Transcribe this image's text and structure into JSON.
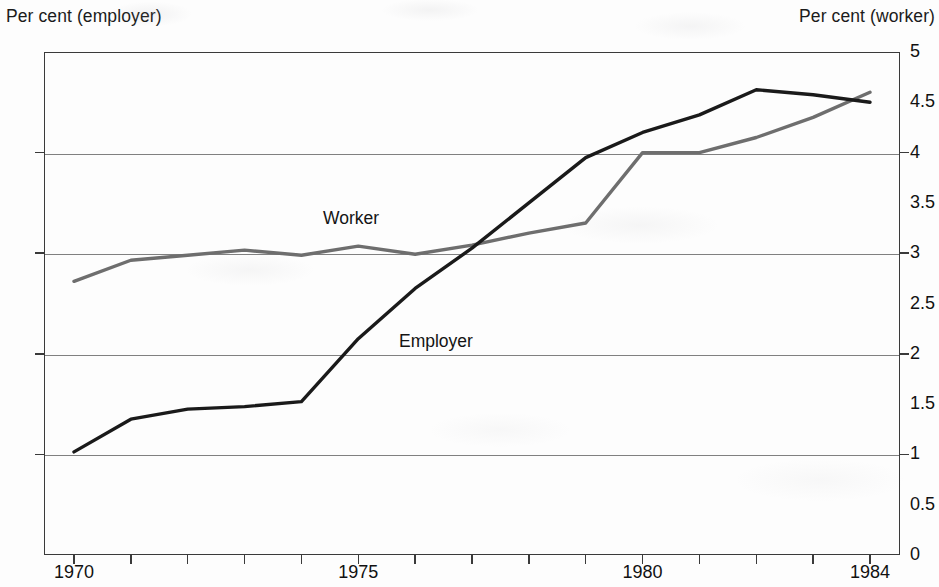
{
  "chart_data": {
    "type": "line",
    "title": "",
    "left_axis": {
      "label": "Per cent (employer)",
      "ticks": [
        "22",
        "20",
        "18",
        "16",
        "14",
        "12"
      ],
      "tick_values": [
        22,
        20,
        18,
        16,
        14,
        12
      ],
      "ylim": [
        12,
        22
      ]
    },
    "right_axis": {
      "label": "Per cent (worker)",
      "ticks": [
        "5",
        "4.5",
        "4",
        "3.5",
        "3",
        "2.5",
        "2",
        "1.5",
        "1",
        "0.5",
        "0"
      ],
      "tick_values": [
        5,
        4.5,
        4,
        3.5,
        3,
        2.5,
        2,
        1.5,
        1,
        0.5,
        0
      ],
      "ylim": [
        0,
        5
      ]
    },
    "xlabel": "",
    "x": [
      1970,
      1971,
      1972,
      1973,
      1974,
      1975,
      1976,
      1977,
      1978,
      1979,
      1980,
      1981,
      1982,
      1983,
      1984
    ],
    "xlim": [
      1970,
      1984
    ],
    "xticks": [
      1970,
      1971,
      1972,
      1973,
      1974,
      1975,
      1976,
      1977,
      1978,
      1979,
      1980,
      1981,
      1982,
      1983,
      1984
    ],
    "xtick_labels": [
      "1970",
      "",
      "",
      "",
      "",
      "1975",
      "",
      "",
      "",
      "",
      "1980",
      "",
      "",
      "",
      "1984"
    ],
    "grid": "horizontal",
    "legend": "inline-labels",
    "series": [
      {
        "name": "Employer",
        "axis": "left",
        "color": "#1a1a1a",
        "label_text": "Employer",
        "values": [
          14.05,
          14.7,
          14.9,
          14.95,
          15.05,
          16.3,
          17.3,
          18.1,
          19.0,
          19.9,
          20.4,
          20.75,
          21.25,
          21.15,
          21.0
        ]
      },
      {
        "name": "Worker",
        "axis": "right",
        "color": "#6e6e6e",
        "label_text": "Worker",
        "values": [
          2.72,
          2.93,
          2.98,
          3.03,
          2.98,
          3.07,
          2.99,
          3.08,
          3.2,
          3.3,
          4.0,
          4.0,
          4.15,
          4.35,
          4.6
        ]
      }
    ]
  },
  "axis_titles": {
    "left": "Per cent (employer)",
    "right": "Per cent (worker)"
  },
  "series_labels": {
    "worker": "Worker",
    "employer": "Employer"
  },
  "colors": {
    "employer_line": "#1a1a1a",
    "worker_line": "#6e6e6e",
    "gridline": "#808080",
    "axis": "#3a3a3a",
    "background": "#fdfdfd",
    "text": "#111111"
  }
}
